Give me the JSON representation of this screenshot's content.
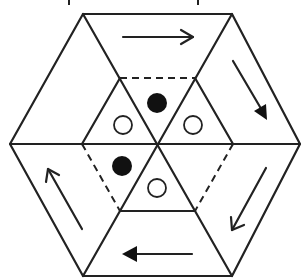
{
  "diagram": {
    "type": "hexagonal rotation puzzle",
    "colors": {
      "line": "#222222",
      "filled_dot": "#111111",
      "background": "#ffffff"
    },
    "outer_hexagon": {
      "vertices": [
        [
          83,
          41
        ],
        [
          232,
          41
        ],
        [
          300,
          144
        ],
        [
          232,
          276
        ],
        [
          83,
          276
        ],
        [
          10,
          144
        ]
      ]
    },
    "inner_regions": {
      "trapezoids": 6,
      "dashed_edges": [
        "top inner edge",
        "lower-left inner edge",
        "lower-right inner edge"
      ]
    },
    "circles": [
      {
        "name": "filled-dot-top",
        "cx": 157,
        "cy": 103,
        "r": 10,
        "filled": true
      },
      {
        "name": "open-dot-upper-left",
        "cx": 123,
        "cy": 125,
        "r": 9,
        "filled": false
      },
      {
        "name": "open-dot-upper-right",
        "cx": 193,
        "cy": 125,
        "r": 9,
        "filled": false
      },
      {
        "name": "filled-dot-lower-left",
        "cx": 122,
        "cy": 166,
        "r": 10,
        "filled": true
      },
      {
        "name": "open-dot-lower-middle",
        "cx": 157,
        "cy": 188,
        "r": 9,
        "filled": false
      }
    ],
    "arrows": [
      {
        "name": "arrow-top-right",
        "direction": "right",
        "style": "open"
      },
      {
        "name": "arrow-right-down",
        "direction": "down-right",
        "style": "filled"
      },
      {
        "name": "arrow-lower-right-down-left",
        "direction": "down-left",
        "style": "open"
      },
      {
        "name": "arrow-bottom-left",
        "direction": "left",
        "style": "filled"
      },
      {
        "name": "arrow-left-up",
        "direction": "up-left",
        "style": "open"
      }
    ]
  }
}
